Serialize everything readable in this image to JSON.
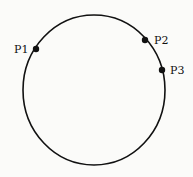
{
  "diagram": {
    "type": "circle-with-points",
    "background": "#fbfbf9",
    "stroke_color": "#111111",
    "circle": {
      "cx": 94,
      "cy": 90,
      "rx": 71,
      "ry": 75
    },
    "points": [
      {
        "label": "P1",
        "x": 36,
        "y": 49,
        "label_x": 14,
        "label_y": 53
      },
      {
        "label": "P2",
        "x": 145,
        "y": 40,
        "label_x": 154,
        "label_y": 44
      },
      {
        "label": "P3",
        "x": 162,
        "y": 70,
        "label_x": 170,
        "label_y": 74
      }
    ]
  }
}
